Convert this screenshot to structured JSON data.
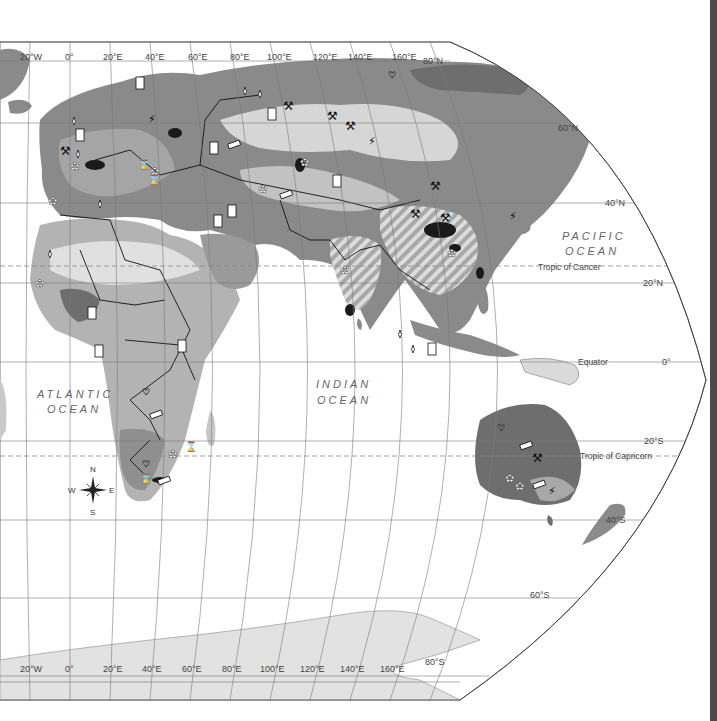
{
  "map": {
    "type": "world-resource-map",
    "projection": "Robinson-like (Eastern Hemisphere)",
    "colors": {
      "ocean": "#ffffff",
      "land_light": "#d6d6d6",
      "land_mid": "#b3b3b3",
      "land_dark": "#8a8a8a",
      "land_darkest": "#6e6e6e",
      "deposit_black": "#1a1a1a",
      "antarctica": "#e2e2e2",
      "graticule": "#7a7a7a",
      "border": "#111111",
      "right_gutter": "#4a4a4a"
    },
    "top_longitude_labels": [
      "20°W",
      "0°",
      "20°E",
      "40°E",
      "60°E",
      "80°E",
      "100°E",
      "120°E",
      "140°E",
      "160°E"
    ],
    "bottom_longitude_labels": [
      "20°W",
      "0°",
      "20°E",
      "40°E",
      "60°E",
      "80°E",
      "100°E",
      "120°E",
      "140°E",
      "160°E"
    ],
    "latitude_labels": {
      "n80": "80°N",
      "n60": "60°N",
      "n40": "40°N",
      "n20": "20°N",
      "eq": "0°",
      "s20": "20°S",
      "s40": "40°S",
      "s60": "60°S",
      "s80": "80°S"
    },
    "special_lines": {
      "tropic_cancer": "Tropic of Cancer",
      "equator": "Equator",
      "tropic_capricorn": "Tropic of Capricorn"
    },
    "oceans": {
      "pacific_line1": "PACIFIC",
      "pacific_line2": "OCEAN",
      "atlantic_line1": "ATLANTIC",
      "atlantic_line2": "OCEAN",
      "indian_line1": "INDIAN",
      "indian_line2": "OCEAN"
    },
    "compass": {
      "n": "N",
      "s": "S",
      "e": "E",
      "w": "W"
    },
    "resource_symbols": [
      "oil-barrel",
      "natural-gas-drop",
      "coal-pick",
      "iron-ingot",
      "uranium-bolt",
      "gems-diamond",
      "bauxite-flower",
      "copper-spool"
    ]
  }
}
